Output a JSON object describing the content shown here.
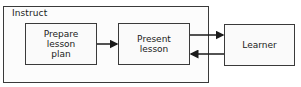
{
  "diagram": {
    "container": {
      "label": "Instruct"
    },
    "nodes": [
      {
        "id": "prepare",
        "label": "Prepare\nlesson\nplan"
      },
      {
        "id": "present",
        "label": "Present\nlesson"
      },
      {
        "id": "learner",
        "label": "Learner"
      }
    ],
    "edges": [
      {
        "from": "prepare",
        "to": "present"
      },
      {
        "from": "present",
        "to": "learner"
      },
      {
        "from": "learner",
        "to": "present"
      }
    ]
  }
}
